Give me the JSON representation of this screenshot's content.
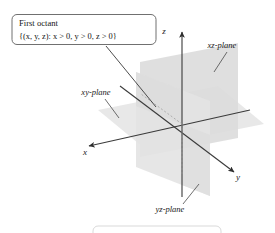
{
  "figure": {
    "background_color": "#ffffff",
    "callout": {
      "line1": "First octant",
      "line2": "{(x, y, z): x > 0, y > 0, z > 0}",
      "border_color": "#555555",
      "fill_color": "#ffffff"
    },
    "axes": [
      {
        "name": "x-axis",
        "label": "x"
      },
      {
        "name": "y-axis",
        "label": "y"
      },
      {
        "name": "z-axis",
        "label": "z"
      }
    ],
    "axis_color": "#3a3a3a",
    "planes": [
      {
        "name": "xy-plane",
        "label": "xy-plane",
        "fill": "#e6e6e6"
      },
      {
        "name": "xz-plane",
        "label": "xz-plane",
        "fill": "#dedede"
      },
      {
        "name": "yz-plane",
        "label": "yz-plane",
        "fill": "#e2e2e2"
      }
    ],
    "plane_labels": {
      "xy": "xy-plane",
      "xz": "xz-plane",
      "yz": "yz-plane"
    },
    "footer_box": {
      "visible": true,
      "border_color": "#cccccc"
    }
  }
}
